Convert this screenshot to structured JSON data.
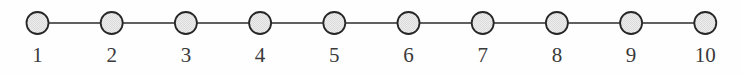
{
  "figure": {
    "kind": "graph-diagram",
    "width": 743,
    "height": 75,
    "background_color": "#fefefe"
  },
  "style": {
    "node_fill": "#e8e8e8",
    "node_stroke": "#262626",
    "node_radius": 11,
    "node_stroke_width": 1.8,
    "edge_stroke": "#2b2b2b",
    "edge_stroke_width": 1.7,
    "label_color": "#3a3a3a",
    "label_font_size": 21,
    "row_center_y": 23,
    "label_baseline_y": 62
  },
  "chart_data": {
    "type": "graph",
    "title": "",
    "layout": "linear-path",
    "node_count": 10,
    "edge_count": 9,
    "nodes": [
      {
        "id": 1,
        "label": "1",
        "cx": 37.5,
        "cy": 23
      },
      {
        "id": 2,
        "label": "2",
        "cx": 111.7,
        "cy": 23
      },
      {
        "id": 3,
        "label": "3",
        "cx": 185.9,
        "cy": 23
      },
      {
        "id": 4,
        "label": "4",
        "cx": 260.1,
        "cy": 23
      },
      {
        "id": 5,
        "label": "5",
        "cx": 334.3,
        "cy": 23
      },
      {
        "id": 6,
        "label": "6",
        "cx": 408.5,
        "cy": 23
      },
      {
        "id": 7,
        "label": "7",
        "cx": 482.7,
        "cy": 23
      },
      {
        "id": 8,
        "label": "8",
        "cx": 556.9,
        "cy": 23
      },
      {
        "id": 9,
        "label": "9",
        "cx": 631.1,
        "cy": 23
      },
      {
        "id": 10,
        "label": "10",
        "cx": 705.3,
        "cy": 23
      }
    ],
    "edges": [
      {
        "from": 1,
        "to": 2
      },
      {
        "from": 2,
        "to": 3
      },
      {
        "from": 3,
        "to": 4
      },
      {
        "from": 4,
        "to": 5
      },
      {
        "from": 5,
        "to": 6
      },
      {
        "from": 6,
        "to": 7
      },
      {
        "from": 7,
        "to": 8
      },
      {
        "from": 8,
        "to": 9
      },
      {
        "from": 9,
        "to": 10
      }
    ]
  }
}
